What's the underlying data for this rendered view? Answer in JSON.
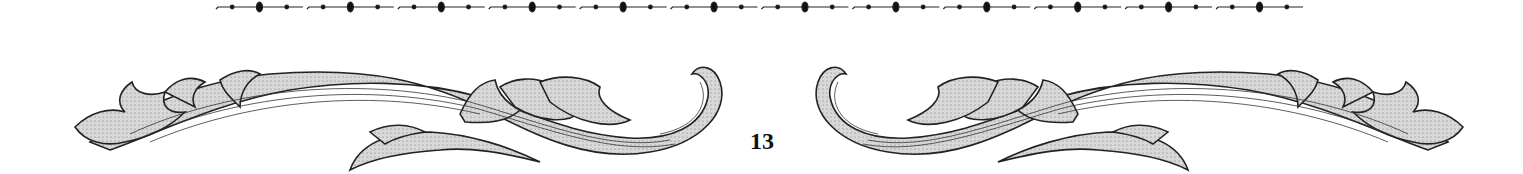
{
  "page": {
    "number": "13"
  },
  "decoration": {
    "rule": {
      "x_start": 214,
      "x_end": 1305,
      "y": 7,
      "segment_count": 12,
      "color": "#111111"
    },
    "ornaments": [
      "acanthus-scroll-left",
      "acanthus-scroll-right"
    ],
    "fill_color": "#cfcfcf",
    "stroke_color": "#222222"
  }
}
